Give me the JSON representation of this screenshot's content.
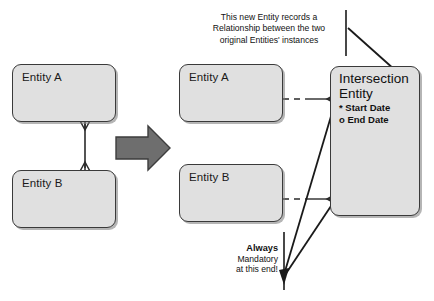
{
  "diagram": {
    "background_color": "#ffffff",
    "entity_fill_color": "#e0e0e0",
    "entity_stroke_color": "#3a3a3a",
    "arrow_color": "#6e6e6e",
    "line_color": "#1a1a1a"
  },
  "left_model": {
    "entity_a": {
      "label": "Entity A"
    },
    "entity_b": {
      "label": "Entity B"
    },
    "relationship": {
      "style": "solid",
      "end_a": "crows-foot",
      "end_b": "crows-foot"
    }
  },
  "transform_arrow": {
    "name": "right-arrow",
    "direction": "right"
  },
  "right_model": {
    "entity_a": {
      "label": "Entity A"
    },
    "entity_b": {
      "label": "Entity B"
    },
    "intersection_entity": {
      "title_line_1": "Intersection",
      "title_line_2": "Entity",
      "attributes": [
        {
          "marker": "*",
          "label": "Start Date"
        },
        {
          "marker": "o",
          "label": "End Date"
        }
      ]
    },
    "relationship_a": {
      "style": "dashed-then-solid",
      "end": "crows-foot"
    },
    "relationship_b": {
      "style": "dashed-then-solid",
      "end": "crows-foot"
    }
  },
  "annotations": {
    "top_note": {
      "line_1": "This new Entity records a",
      "line_2": "Relationship between the two",
      "line_3": "original Entities' instances"
    },
    "bottom_note": {
      "line_1": "Always",
      "line_2": "Mandatory",
      "line_3": "at this end!"
    }
  }
}
